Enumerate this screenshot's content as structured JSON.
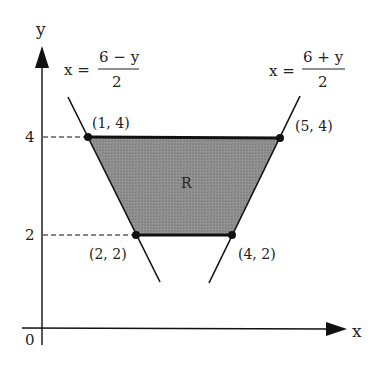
{
  "axes": {
    "x_label": "x",
    "y_label": "y",
    "origin_label": "0",
    "y_ticks": [
      "4",
      "2"
    ]
  },
  "curves": {
    "left": {
      "lhs": "x =",
      "numerator": "6 − y",
      "denominator": "2"
    },
    "right": {
      "lhs": "x =",
      "numerator": "6 + y",
      "denominator": "2"
    }
  },
  "region": {
    "label": "R",
    "fill": "#8c8c8c"
  },
  "points": [
    {
      "label": "(1, 4)"
    },
    {
      "label": "(5, 4)"
    },
    {
      "label": "(2, 2)"
    },
    {
      "label": "(4, 2)"
    }
  ]
}
